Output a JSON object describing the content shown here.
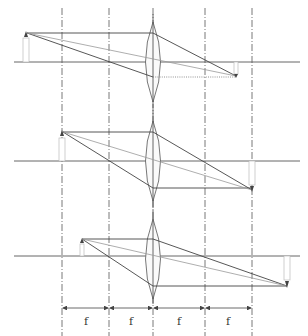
{
  "diagram": {
    "type": "converging-lens-ray-diagrams",
    "lens_x": 153,
    "guide_lines_x": [
      62,
      109,
      153,
      205,
      252
    ],
    "focal_labels": [
      "f",
      "f",
      "f",
      "f"
    ],
    "cases": [
      {
        "name": "object-beyond-2f",
        "axis_y": 62,
        "object_x": 26,
        "object_top_y": 33,
        "image_x": 236,
        "image_tip_y": 76
      },
      {
        "name": "object-at-2f",
        "axis_y": 161,
        "object_x": 62,
        "object_top_y": 132,
        "image_x": 252,
        "image_tip_y": 190
      },
      {
        "name": "object-between-f-and-2f",
        "axis_y": 256,
        "object_x": 82,
        "object_top_y": 239,
        "image_x": 287,
        "image_tip_y": 286
      }
    ]
  }
}
